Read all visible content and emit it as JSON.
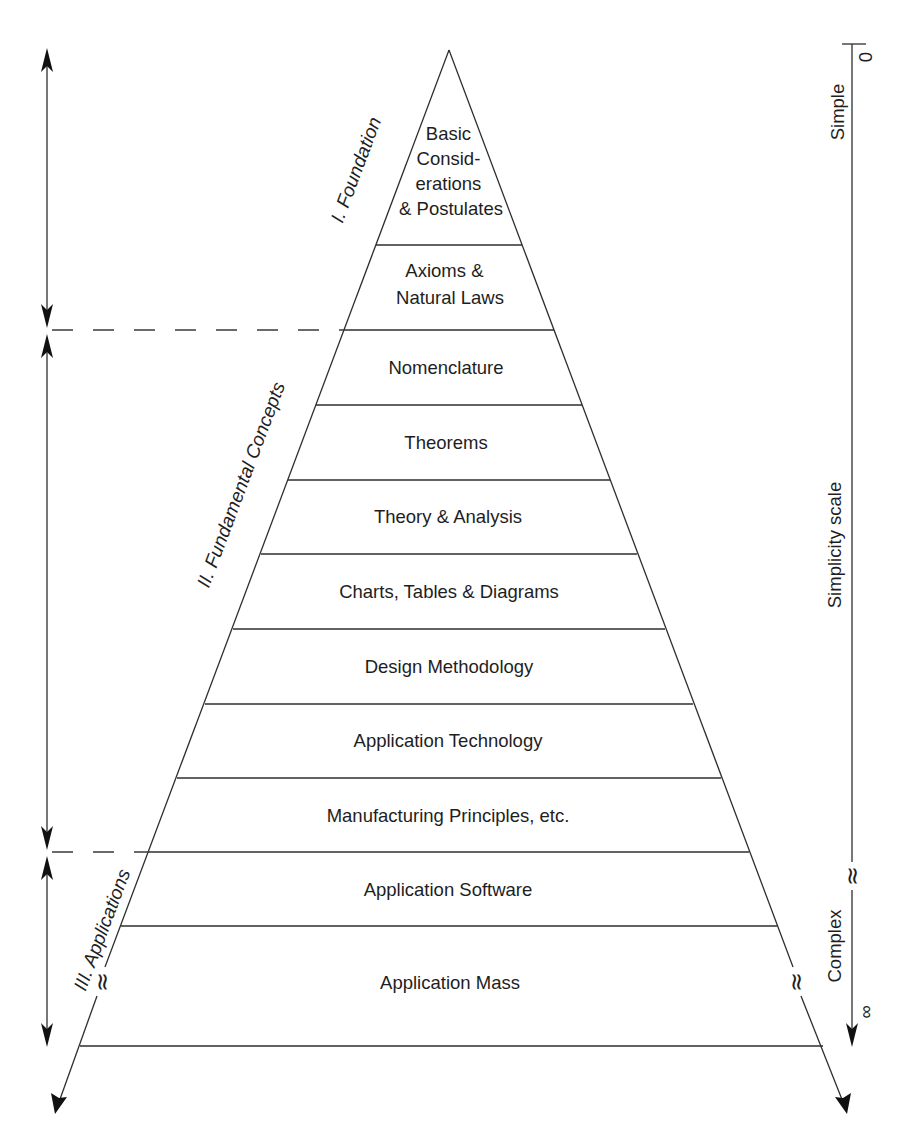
{
  "diagram": {
    "type": "pyramid",
    "levels": [
      {
        "label_lines": [
          "Basic",
          "Consid-",
          "erations",
          "& Postulates"
        ]
      },
      {
        "label_lines": [
          "Axioms &",
          "Natural Laws"
        ]
      },
      {
        "label_lines": [
          "Nomenclature"
        ]
      },
      {
        "label_lines": [
          "Theorems"
        ]
      },
      {
        "label_lines": [
          "Theory & Analysis"
        ]
      },
      {
        "label_lines": [
          "Charts, Tables & Diagrams"
        ]
      },
      {
        "label_lines": [
          "Design Methodology"
        ]
      },
      {
        "label_lines": [
          "Application Technology"
        ]
      },
      {
        "label_lines": [
          "Manufacturing Principles, etc."
        ]
      },
      {
        "label_lines": [
          "Application Software"
        ]
      },
      {
        "label_lines": [
          "Application Mass"
        ]
      }
    ],
    "groups": [
      {
        "label": "I. Foundation",
        "spans_levels": [
          0,
          1
        ]
      },
      {
        "label": "II. Fundamental Concepts",
        "spans_levels": [
          2,
          8
        ]
      },
      {
        "label": "III. Applications",
        "spans_levels": [
          9,
          10
        ]
      }
    ],
    "scale": {
      "title": "Simplicity scale",
      "start_label": "Simple",
      "start_value": "0",
      "end_label": "Complex",
      "end_value": "∞",
      "break_symbol": "≈"
    }
  }
}
